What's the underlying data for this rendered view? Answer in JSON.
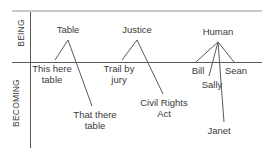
{
  "diagram": {
    "colors": {
      "text": "#3a3a3a",
      "line": "#5a5a5a",
      "top_rule": "#c9c9c9",
      "background": "#ffffff"
    },
    "axes": {
      "upper_label": "BEING",
      "lower_label": "BECOMING",
      "vertical_axis_x": 30,
      "horizontal_axis_y": 62,
      "top_rule_y": 11
    },
    "groups": [
      {
        "id": "table",
        "universal": "Table",
        "apex": {
          "x": 68,
          "y": 40
        },
        "particulars": [
          {
            "label": "This here\ntable",
            "x": 52,
            "y": 64,
            "endpoint": {
              "x": 55,
              "y": 60
            }
          },
          {
            "label": "That there\ntable",
            "x": 95,
            "y": 110,
            "endpoint": {
              "x": 92,
              "y": 106
            }
          }
        ]
      },
      {
        "id": "justice",
        "universal": "Justice",
        "apex": {
          "x": 137,
          "y": 40
        },
        "particulars": [
          {
            "label": "Trail by\njury",
            "x": 119,
            "y": 64,
            "endpoint": {
              "x": 122,
              "y": 60
            }
          },
          {
            "label": "Civil Rights\nAct",
            "x": 164,
            "y": 98,
            "endpoint": {
              "x": 163,
              "y": 94
            }
          }
        ]
      },
      {
        "id": "human",
        "universal": "Human",
        "apex": {
          "x": 218,
          "y": 42
        },
        "particulars": [
          {
            "label": "Bill",
            "x": 198,
            "y": 66,
            "endpoint": {
              "x": 196,
              "y": 62
            }
          },
          {
            "label": "Sally",
            "x": 212,
            "y": 80,
            "endpoint": {
              "x": 209,
              "y": 76
            }
          },
          {
            "label": "Janet",
            "x": 219,
            "y": 126,
            "endpoint": {
              "x": 224,
              "y": 122
            }
          },
          {
            "label": "Sean",
            "x": 236,
            "y": 66,
            "endpoint": {
              "x": 234,
              "y": 62
            }
          }
        ]
      }
    ],
    "universal_labels": [
      {
        "text": "Table",
        "x": 68,
        "y": 25
      },
      {
        "text": "Justice",
        "x": 137,
        "y": 25
      },
      {
        "text": "Human",
        "x": 218,
        "y": 27
      }
    ]
  }
}
